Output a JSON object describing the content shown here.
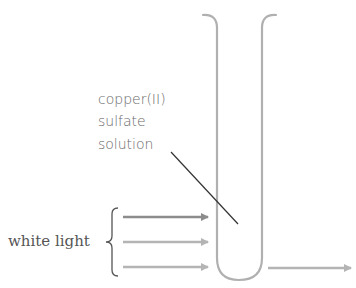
{
  "diagram": {
    "type": "science-apparatus",
    "labels": {
      "solution_line1": "copper(II)",
      "solution_line2": "sulfate",
      "solution_line3": "solution",
      "light_source": "white light"
    },
    "components": {
      "test_tube": "test-tube",
      "incoming_rays": [
        "light-ray-1",
        "light-ray-2",
        "light-ray-3"
      ],
      "outgoing_ray": "transmitted-light-ray",
      "brace": "grouping-brace",
      "leader_line": "label-pointer-line"
    },
    "colors": {
      "tube": "#b0b0b0",
      "ray_dark": "#8c8c8c",
      "ray_light": "#b4b4b4",
      "leader": "#333333",
      "text": "#5a5a5a"
    }
  }
}
